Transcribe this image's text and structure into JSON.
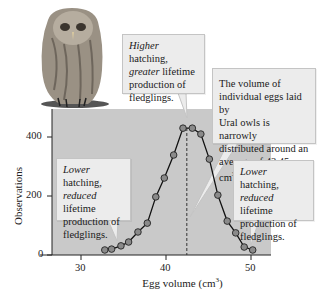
{
  "chart_data": {
    "type": "line",
    "title": "",
    "xlabel": "Egg volume (cm³)",
    "ylabel": "Observations",
    "xlim": [
      26,
      52
    ],
    "ylim": [
      0,
      470
    ],
    "xticks": [
      30,
      40,
      50
    ],
    "yticks": [
      0,
      200,
      400
    ],
    "grid": false,
    "legend": null,
    "series": [
      {
        "name": "Observations",
        "x": [
          32.8,
          33.6,
          34.7,
          35.6,
          36.7,
          37.8,
          38.8,
          39.8,
          40.9,
          42.0,
          43.1,
          44.1,
          45.1,
          46.1,
          47.2,
          48.2,
          49.2,
          50.2
        ],
        "values": [
          17,
          20,
          31,
          44,
          78,
          108,
          197,
          261,
          339,
          430,
          430,
          410,
          325,
          203,
          115,
          75,
          27,
          17
        ]
      }
    ],
    "mean_line": {
      "x": 42.45,
      "style": "dashed"
    },
    "annotations": [
      {
        "id": "top",
        "lines": [
          [
            "Higher",
            " hatching,"
          ],
          [
            "greater",
            " lifetime"
          ],
          [
            "",
            "production of"
          ],
          [
            "",
            "fledglings."
          ]
        ]
      },
      {
        "id": "right",
        "text": "The volume of individual eggs laid by Ural owls is narrowly distributed around an average of 42.45 cm³."
      },
      {
        "id": "left",
        "lines": [
          [
            "Lower",
            " hatching,"
          ],
          [
            "reduced",
            " lifetime"
          ],
          [
            "",
            "production of"
          ],
          [
            "",
            "fledglings."
          ]
        ]
      },
      {
        "id": "right-bottom",
        "lines": [
          [
            "Lower",
            " hatching,"
          ],
          [
            "reduced",
            " lifetime"
          ],
          [
            "",
            "production of"
          ],
          [
            "",
            "fledglings."
          ]
        ]
      }
    ]
  },
  "labels": {
    "xlabel": "Egg volume (cm",
    "xlabel_sup": "3",
    "xlabel_end": ")",
    "ylabel": "Observations",
    "xtick_30": "30",
    "xtick_40": "40",
    "xtick_50": "50",
    "ytick_0": "0",
    "ytick_200": "200",
    "ytick_400": "400"
  },
  "callouts": {
    "top": {
      "l1_em": "Higher",
      "l1": " hatching,",
      "l2_em": "greater",
      "l2": " lifetime",
      "l3": "production of",
      "l4": "fledglings."
    },
    "right": {
      "l1": "The volume of",
      "l2": "individual eggs laid by",
      "l3": "Ural owls is narrowly",
      "l4": "distributed around an",
      "l5": "average of 42.45 cm",
      "l5_sup": "3",
      "l5_end": "."
    },
    "left": {
      "l1_em": "Lower",
      "l1": " hatching,",
      "l2_em": "reduced",
      "l2": " lifetime",
      "l3": "production of",
      "l4": "fledglings."
    },
    "right_bottom": {
      "l1_em": "Lower",
      "l1": " hatching,",
      "l2_em": "reduced",
      "l2": " lifetime",
      "l3": "production of",
      "l4": "fledglings."
    }
  },
  "colors": {
    "plot_bg": "#c9c9c9",
    "marker_fill": "#8a8a8a",
    "line": "#111111",
    "callout_bg": "#ececec"
  }
}
